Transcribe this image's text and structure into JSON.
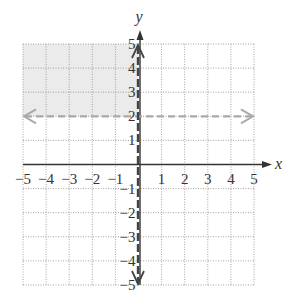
{
  "chart_data": {
    "type": "inequality_graph",
    "title": "",
    "xlabel": "x",
    "ylabel": "y",
    "xlim": [
      -5,
      5
    ],
    "ylim": [
      -5,
      5
    ],
    "grid": true,
    "x_ticks": [
      "-5",
      "-4",
      "-3",
      "-2",
      "-1",
      "1",
      "2",
      "3",
      "4",
      "5"
    ],
    "y_ticks": [
      "5",
      "4",
      "3",
      "2",
      "1",
      "-1",
      "-2",
      "-3",
      "-4",
      "-5"
    ],
    "boundary_lines": [
      {
        "equation": "y = 2",
        "style": "dashed",
        "color": "#a9a9a9"
      },
      {
        "equation": "x = 0",
        "style": "dashed",
        "color": "#444444"
      }
    ],
    "shaded_region": {
      "description": "x < 0 and y > 2",
      "x_range": [
        -5,
        0
      ],
      "y_range": [
        2,
        5
      ],
      "color": "#ebebeb"
    }
  },
  "colors": {
    "axis": "#333333",
    "grid": "#9a9a9a",
    "shade": "#ebebeb",
    "horizontal_boundary": "#a9a9a9",
    "vertical_boundary": "#444444"
  }
}
